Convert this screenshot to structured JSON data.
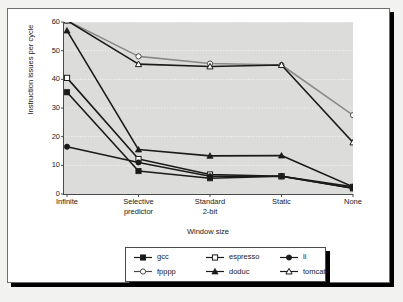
{
  "page": {
    "top_fragment": ""
  },
  "chart_data": {
    "type": "line",
    "title": "",
    "xlabel": "Window size",
    "ylabel": "Instruction issues per cycle",
    "categories": [
      "Infinite",
      "Selective predictor",
      "Standard 2-bit",
      "Static",
      "None"
    ],
    "category_lines": [
      [
        "Infinite"
      ],
      [
        "Selective",
        "predictor"
      ],
      [
        "Standard",
        "2-bit"
      ],
      [
        "Static"
      ],
      [
        "None"
      ]
    ],
    "ylim": [
      0,
      60
    ],
    "ytick_values": [
      0,
      10,
      20,
      30,
      40,
      50,
      60
    ],
    "ytick_labels": [
      "0",
      "10",
      "20",
      "30",
      "40",
      "50",
      "60"
    ],
    "grid": true,
    "grid_style": "dotted-horizontal",
    "legend_position": "bottom",
    "series": [
      {
        "name": "gcc",
        "marker": "filled-square",
        "color": "#1a1a1a",
        "values": [
          35.5,
          8.0,
          5.5,
          6.2,
          2.5
        ]
      },
      {
        "name": "espresso",
        "marker": "open-square",
        "color": "#1a1a1a",
        "values": [
          40.5,
          12.2,
          6.8,
          6.2,
          2.0
        ]
      },
      {
        "name": "li",
        "marker": "filled-circle",
        "color": "#1a1a1a",
        "values": [
          16.5,
          11.0,
          6.2,
          6.2,
          2.0
        ]
      },
      {
        "name": "fpppp",
        "marker": "open-circle",
        "color": "#8a8a8a",
        "values": [
          60.5,
          48.0,
          45.5,
          45.0,
          27.5
        ]
      },
      {
        "name": "doduc",
        "marker": "filled-triangle",
        "color": "#1a1a1a",
        "values": [
          57.0,
          15.5,
          13.3,
          13.4,
          2.5
        ]
      },
      {
        "name": "tomcatv",
        "marker": "open-triangle",
        "color": "#1a1a1a",
        "values": [
          60.5,
          45.3,
          44.5,
          45.0,
          18.0
        ]
      }
    ]
  },
  "legend": {
    "entries": [
      {
        "label": "gcc",
        "marker": "filled-square"
      },
      {
        "label": "espresso",
        "marker": "open-square"
      },
      {
        "label": "li",
        "marker": "filled-circle"
      },
      {
        "label": "fpppp",
        "marker": "open-circle"
      },
      {
        "label": "doduc",
        "marker": "filled-triangle"
      },
      {
        "label": "tomcatv",
        "marker": "open-triangle"
      }
    ]
  }
}
